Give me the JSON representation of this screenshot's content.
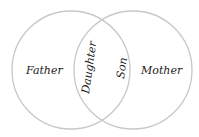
{
  "diagram": {
    "type": "venn",
    "sets": [
      {
        "name": "Father",
        "cx": 71,
        "cy": 70,
        "r": 59
      },
      {
        "name": "Mother",
        "cx": 133,
        "cy": 70,
        "r": 59
      }
    ],
    "labels": {
      "left": "Father",
      "right": "Mother",
      "overlap_left": "Daughter",
      "overlap_right": "Son"
    },
    "stroke_color": "#c8c8c8"
  }
}
